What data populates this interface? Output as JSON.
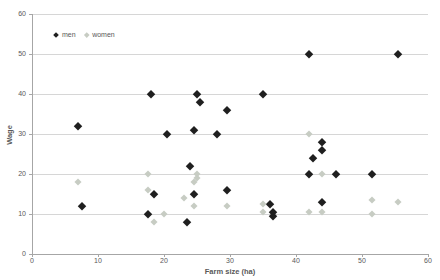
{
  "chart_data": {
    "type": "scatter",
    "title": "",
    "xlabel": "Farm size (ha)",
    "ylabel": "Wage",
    "xlim": [
      0,
      60
    ],
    "ylim": [
      0,
      60
    ],
    "xticks": [
      0,
      10,
      20,
      30,
      40,
      50,
      60
    ],
    "yticks": [
      0,
      10,
      20,
      30,
      40,
      50,
      60
    ],
    "grid": "horizontal-only",
    "legend_position": "inside-top-left",
    "series": [
      {
        "name": "men",
        "marker": "diamond",
        "color": "#1f1f1f",
        "points": [
          [
            7,
            32
          ],
          [
            7.5,
            12
          ],
          [
            17.5,
            10
          ],
          [
            18,
            40
          ],
          [
            18.5,
            15
          ],
          [
            20.5,
            30
          ],
          [
            23.5,
            8
          ],
          [
            24,
            22
          ],
          [
            24.5,
            15
          ],
          [
            24.5,
            31
          ],
          [
            25,
            40
          ],
          [
            25.5,
            38
          ],
          [
            28,
            30
          ],
          [
            29.5,
            16
          ],
          [
            29.5,
            36
          ],
          [
            35,
            40
          ],
          [
            36,
            12.5
          ],
          [
            36.5,
            10.5
          ],
          [
            36.5,
            9.5
          ],
          [
            42,
            20
          ],
          [
            42,
            50
          ],
          [
            42.5,
            24
          ],
          [
            44,
            13
          ],
          [
            44,
            26
          ],
          [
            44,
            28
          ],
          [
            46,
            20
          ],
          [
            51.5,
            20
          ],
          [
            55.5,
            50
          ]
        ]
      },
      {
        "name": "women",
        "marker": "diamond",
        "color": "#c7ccc3",
        "points": [
          [
            7,
            18
          ],
          [
            17.5,
            16
          ],
          [
            17.5,
            20
          ],
          [
            18.5,
            8
          ],
          [
            20,
            10
          ],
          [
            23,
            14
          ],
          [
            24.5,
            12
          ],
          [
            24.5,
            18
          ],
          [
            25,
            19
          ],
          [
            25,
            20
          ],
          [
            29.5,
            12
          ],
          [
            35,
            10.5
          ],
          [
            35,
            12.5
          ],
          [
            42,
            10.5
          ],
          [
            42,
            30
          ],
          [
            44,
            10.5
          ],
          [
            44,
            20
          ],
          [
            51.5,
            10
          ],
          [
            51.5,
            13.5
          ],
          [
            55.5,
            13
          ]
        ]
      }
    ]
  },
  "colors": {
    "gridline": "#d6d6d6",
    "axis_line": "#a6a6a6",
    "tick_text": "#595959",
    "men_marker": "#1f1f1f",
    "women_marker": "#c7ccc3",
    "background": "#ffffff"
  }
}
